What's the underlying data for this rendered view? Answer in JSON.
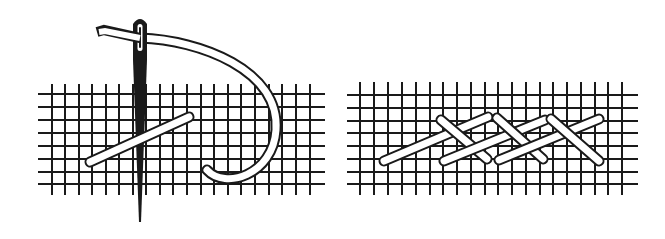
{
  "figure": {
    "description": "Line illustration of embroidery stitching on an evenweave canvas grid",
    "colors": {
      "ink": "#1a1a1a",
      "background": "#ffffff",
      "thread": "#ffffff"
    },
    "panels": [
      {
        "name": "needle-and-first-stitch",
        "grid": {
          "x0": 38,
          "x1": 325,
          "y0": 94,
          "y1": 185,
          "cols": [
            52,
            65,
            79,
            92,
            106,
            119,
            133,
            146,
            160,
            173,
            187,
            201,
            214,
            228,
            241,
            255,
            269,
            282,
            296,
            310
          ],
          "rows": [
            94,
            107,
            120,
            133,
            146,
            159,
            172,
            184
          ],
          "col_top": 84,
          "col_bottom": 195
        },
        "needle": {
          "x_top": 140,
          "y_top": 20,
          "x_tip": 139,
          "y_tip": 222
        },
        "stitches": [
          {
            "x1": 90,
            "y1": 162,
            "x2": 189,
            "y2": 117
          }
        ]
      },
      {
        "name": "herringbone-stitch",
        "grid": {
          "x0": 347,
          "x1": 638,
          "y0": 93,
          "y1": 187,
          "cols": [
            360,
            374,
            388,
            402,
            416,
            430,
            443,
            457,
            471,
            485,
            498,
            512,
            526,
            540,
            553,
            567,
            581,
            595,
            608,
            622
          ],
          "rows": [
            95,
            108,
            121,
            133,
            146,
            159,
            172,
            184
          ],
          "col_top": 82,
          "col_bottom": 195
        },
        "stitches": [
          {
            "x1": 384,
            "y1": 161,
            "x2": 488,
            "y2": 117
          },
          {
            "x1": 441,
            "y1": 120,
            "x2": 487,
            "y2": 159
          },
          {
            "x1": 444,
            "y1": 161,
            "x2": 545,
            "y2": 120
          },
          {
            "x1": 497,
            "y1": 118,
            "x2": 543,
            "y2": 159
          },
          {
            "x1": 499,
            "y1": 160,
            "x2": 599,
            "y2": 119
          },
          {
            "x1": 551,
            "y1": 119,
            "x2": 599,
            "y2": 161
          }
        ]
      }
    ]
  }
}
